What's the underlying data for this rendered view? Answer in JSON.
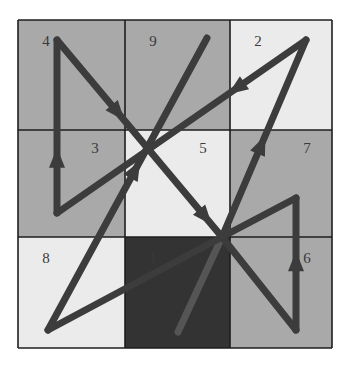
{
  "diagram": {
    "grid": {
      "x0": 18,
      "y0": 20,
      "x1": 332,
      "y1": 348,
      "cols": [
        18,
        125,
        230,
        332
      ],
      "rows": [
        20,
        130,
        237,
        348
      ]
    },
    "colors": {
      "medium": "#a9a9a9",
      "light": "#ebebeb",
      "dark": "#333333",
      "line": "#1e1e1e",
      "path": "#3c3c3c",
      "path_faint": "#555555"
    },
    "cells": [
      {
        "row": 0,
        "col": 0,
        "label": "4",
        "shade": "medium",
        "lx": 46,
        "ly": 46
      },
      {
        "row": 0,
        "col": 1,
        "label": "9",
        "shade": "medium",
        "lx": 153,
        "ly": 46
      },
      {
        "row": 0,
        "col": 2,
        "label": "2",
        "shade": "light",
        "lx": 258,
        "ly": 46
      },
      {
        "row": 1,
        "col": 0,
        "label": "3",
        "shade": "medium",
        "lx": 95,
        "ly": 153
      },
      {
        "row": 1,
        "col": 1,
        "label": "5",
        "shade": "light",
        "lx": 203,
        "ly": 153
      },
      {
        "row": 1,
        "col": 2,
        "label": "7",
        "shade": "medium",
        "lx": 307,
        "ly": 153
      },
      {
        "row": 2,
        "col": 0,
        "label": "8",
        "shade": "light",
        "lx": 46,
        "ly": 263
      },
      {
        "row": 2,
        "col": 1,
        "label": "1",
        "shade": "dark",
        "lx": 153,
        "ly": 263
      },
      {
        "row": 2,
        "col": 2,
        "label": "6",
        "shade": "medium",
        "lx": 307,
        "ly": 263
      }
    ],
    "path_points": [
      [
        178,
        332
      ],
      [
        222,
        237
      ],
      [
        306,
        40
      ],
      [
        57,
        213
      ],
      [
        57,
        40
      ],
      [
        222,
        237
      ],
      [
        296,
        330
      ],
      [
        296,
        198
      ],
      [
        222,
        237
      ],
      [
        48,
        330
      ],
      [
        207,
        38
      ]
    ]
  }
}
